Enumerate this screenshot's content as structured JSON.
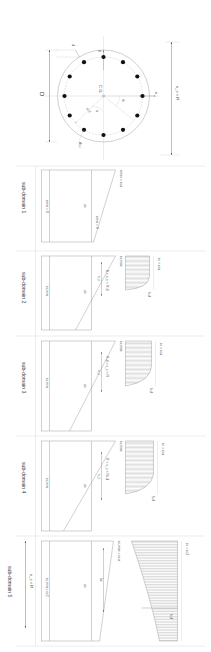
{
  "figure": {
    "type": "engineering-diagram",
    "orientation": "rotated-90-clockwise"
  },
  "subdomains": [
    {
      "id": 1,
      "label": "sub-domain 1"
    },
    {
      "id": 2,
      "label": "sub-domain 2"
    },
    {
      "id": 3,
      "label": "sub-domain 3"
    },
    {
      "id": 4,
      "label": "sub-domain 4"
    },
    {
      "id": 5,
      "label": "sub-domain 5"
    }
  ],
  "range_labels": {
    "sd1": "x_c < 0",
    "sd2": "0 < x_c < R-d",
    "sd3": "R-d < x_c < R",
    "sd4": "R < x_c < R+d",
    "sd5": "x_c > R"
  },
  "strain_labels": {
    "eps_cu": "εcu",
    "eps_c2": "εc2",
    "eps_c": "εc",
    "eps_s": "εs",
    "eps_su": "εsu",
    "eps_yd": "εyd",
    "eps_s_max": "εs,max",
    "eps_s_min": "εs,min",
    "eps_max_eq_su": "εmax = εsu",
    "eps_min_eq_0": "εmin = 0",
    "eps_c_eq_cu": "εc = εcu",
    "eps_c_lt_cu": "εc < εcu",
    "eps_c_eq_c2": "εc = εc2",
    "eps_cmax_eq_cu": "εc,max = εcu",
    "eps_cmin_eq_0": "εc,min = 0",
    "eps_cmin_eq_c2": "εc,min = εc2"
  },
  "stress_labels": {
    "fcd": "fcd",
    "sigma_c": "σc",
    "sigma_s": "σs"
  },
  "geometry": {
    "diameter": "D",
    "cover": "d",
    "radius_inner": "R-d",
    "centroid": "C.G",
    "axis_x": "x",
    "axis_y": "y",
    "neutral_axis": "x_c",
    "angle_theta": "θi",
    "angle_alpha": "α",
    "bar_area": "As,i",
    "rebar_count": 12
  },
  "dimension_labels": {
    "xc_gt_R": "x_c > R",
    "xc_lt_R": "x_c < R",
    "R": "R",
    "lambda_x": "λx",
    "xc": "x_c",
    "d": "d"
  },
  "colors": {
    "line": "#8c8c8c",
    "line_dark": "#6d6d6d",
    "line_light": "#b5b5b5",
    "rebar": "#111111",
    "hatch": "#9a9a9a",
    "background": "#ffffff"
  }
}
